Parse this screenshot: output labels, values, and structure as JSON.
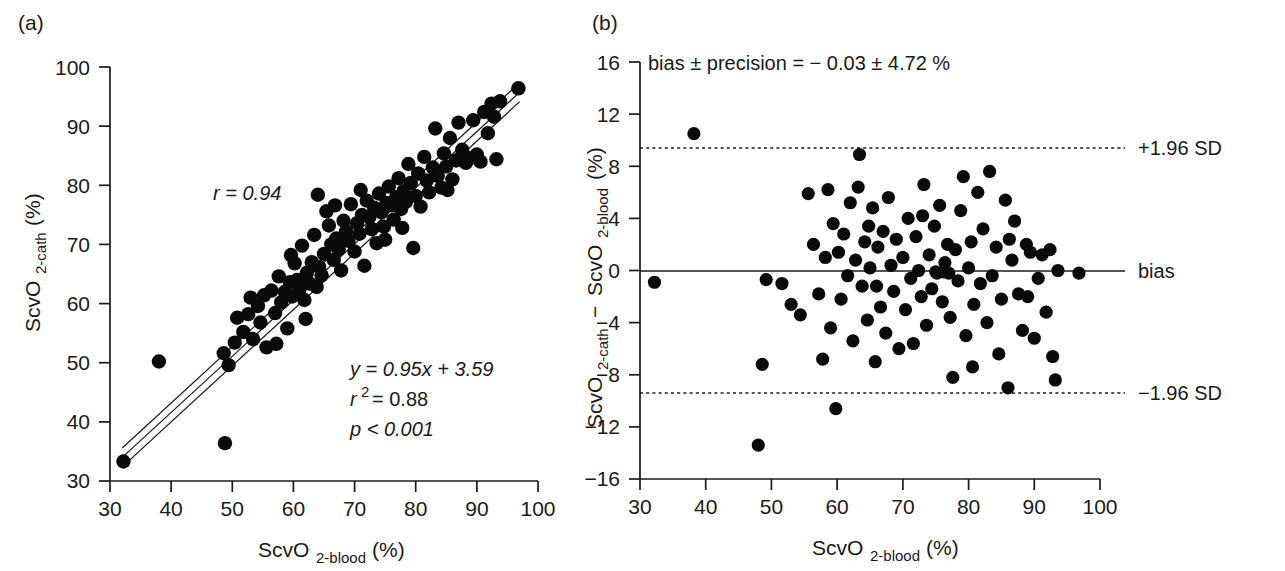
{
  "figure": {
    "background": "#ffffff",
    "marker_color": "#0a0a0a",
    "axis_color": "#1a1a1a"
  },
  "panel_a": {
    "tag": "(a)",
    "xlabel_main": "ScvO",
    "xlabel_sub": "2-blood",
    "xlabel_unit": "(%)",
    "ylabel_main": "ScvO",
    "ylabel_sub": "2-cath",
    "ylabel_unit": "(%)",
    "x_ticks": [
      "30",
      "40",
      "50",
      "60",
      "70",
      "80",
      "90",
      "100"
    ],
    "y_ticks": [
      "30",
      "40",
      "50",
      "60",
      "70",
      "80",
      "90",
      "100"
    ],
    "annotations": {
      "r": "r = 0.94",
      "equation": "y = 0.95x + 3.59",
      "r2_label": "r",
      "r2_sup": "2",
      "r2_value": "= 0.88",
      "p_value": "p < 0.001"
    }
  },
  "panel_b": {
    "tag": "(b)",
    "xlabel_main": "ScvO",
    "xlabel_sub": "2-blood",
    "xlabel_unit": "(%)",
    "ylabel_part1": "ScvO",
    "ylabel_sub1": "2-cath",
    "ylabel_minus": " − ",
    "ylabel_part2": "ScvO",
    "ylabel_sub2": "2-blood",
    "ylabel_unit": "(%)",
    "x_ticks": [
      "30",
      "40",
      "50",
      "60",
      "70",
      "80",
      "90",
      "100"
    ],
    "y_ticks": [
      "16",
      "12",
      "8",
      "4",
      "0",
      "−4",
      "−8",
      "−12",
      "−16"
    ],
    "header": "bias ± precision = − 0.03 ± 4.72 %",
    "line_labels": {
      "upper": "+1.96 SD",
      "bias": "bias",
      "lower": "−1.96 SD"
    }
  },
  "chart_data": [
    {
      "type": "scatter",
      "panel": "a",
      "title": "",
      "xlabel": "ScvO2-blood (%)",
      "ylabel": "ScvO2-cath (%)",
      "xlim": [
        30,
        100
      ],
      "ylim": [
        30,
        100
      ],
      "xticks": [
        30,
        40,
        50,
        60,
        70,
        80,
        90,
        100
      ],
      "yticks": [
        30,
        40,
        50,
        60,
        70,
        80,
        90,
        100
      ],
      "grid": false,
      "legend": "none",
      "annotations": [
        "r = 0.94",
        "y = 0.95x + 3.59",
        "r2 = 0.88",
        "p < 0.001"
      ],
      "fit": {
        "slope": 0.95,
        "intercept": 3.59,
        "r": 0.94,
        "r2": 0.88,
        "p": "<0.001",
        "band_offset": 1.6,
        "x_range": [
          32,
          97
        ]
      },
      "points": [
        [
          32.2,
          33.3
        ],
        [
          38.0,
          50.2
        ],
        [
          48.8,
          36.4
        ],
        [
          48.6,
          51.6
        ],
        [
          49.4,
          49.6
        ],
        [
          50.4,
          53.4
        ],
        [
          50.8,
          57.6
        ],
        [
          51.8,
          55.2
        ],
        [
          52.6,
          58.2
        ],
        [
          53.4,
          54.0
        ],
        [
          54.2,
          59.6
        ],
        [
          54.6,
          56.8
        ],
        [
          55.2,
          61.4
        ],
        [
          55.6,
          52.6
        ],
        [
          56.4,
          62.2
        ],
        [
          57.0,
          58.4
        ],
        [
          57.6,
          64.6
        ],
        [
          58.0,
          60.2
        ],
        [
          58.6,
          62.0
        ],
        [
          59.0,
          55.8
        ],
        [
          59.4,
          63.6
        ],
        [
          59.8,
          61.2
        ],
        [
          60.2,
          66.8
        ],
        [
          60.6,
          64.0
        ],
        [
          61.0,
          62.4
        ],
        [
          61.4,
          69.8
        ],
        [
          61.8,
          60.6
        ],
        [
          62.2,
          65.2
        ],
        [
          62.6,
          63.4
        ],
        [
          63.0,
          67.0
        ],
        [
          63.4,
          71.6
        ],
        [
          63.8,
          62.8
        ],
        [
          64.2,
          66.2
        ],
        [
          64.6,
          64.8
        ],
        [
          65.0,
          68.4
        ],
        [
          65.4,
          75.6
        ],
        [
          65.8,
          73.2
        ],
        [
          66.2,
          70.0
        ],
        [
          66.6,
          67.4
        ],
        [
          67.0,
          71.0
        ],
        [
          67.4,
          69.2
        ],
        [
          67.8,
          65.6
        ],
        [
          68.2,
          74.0
        ],
        [
          68.6,
          72.2
        ],
        [
          69.0,
          70.6
        ],
        [
          69.4,
          76.8
        ],
        [
          70.0,
          68.8
        ],
        [
          70.4,
          73.6
        ],
        [
          70.8,
          71.8
        ],
        [
          71.2,
          75.0
        ],
        [
          71.6,
          66.4
        ],
        [
          72.0,
          77.4
        ],
        [
          72.4,
          74.6
        ],
        [
          72.8,
          72.6
        ],
        [
          73.2,
          76.2
        ],
        [
          73.6,
          70.2
        ],
        [
          74.0,
          78.6
        ],
        [
          74.4,
          75.4
        ],
        [
          74.8,
          73.0
        ],
        [
          75.2,
          77.0
        ],
        [
          75.6,
          79.8
        ],
        [
          76.0,
          76.6
        ],
        [
          76.4,
          74.2
        ],
        [
          76.8,
          78.0
        ],
        [
          77.2,
          81.2
        ],
        [
          77.6,
          76.0
        ],
        [
          78.0,
          79.0
        ],
        [
          78.4,
          77.2
        ],
        [
          78.8,
          83.6
        ],
        [
          79.2,
          80.4
        ],
        [
          79.6,
          69.4
        ],
        [
          80.0,
          78.2
        ],
        [
          80.4,
          82.0
        ],
        [
          80.8,
          76.4
        ],
        [
          81.4,
          84.8
        ],
        [
          81.8,
          80.8
        ],
        [
          82.2,
          78.8
        ],
        [
          82.8,
          83.0
        ],
        [
          83.2,
          89.6
        ],
        [
          83.6,
          81.6
        ],
        [
          84.2,
          79.6
        ],
        [
          84.6,
          85.4
        ],
        [
          85.0,
          83.2
        ],
        [
          85.6,
          88.0
        ],
        [
          86.0,
          81.0
        ],
        [
          86.6,
          84.2
        ],
        [
          87.0,
          90.6
        ],
        [
          87.6,
          86.0
        ],
        [
          88.2,
          83.8
        ],
        [
          88.8,
          84.6
        ],
        [
          89.4,
          91.0
        ],
        [
          90.0,
          85.2
        ],
        [
          90.6,
          84.0
        ],
        [
          91.2,
          92.4
        ],
        [
          91.8,
          88.8
        ],
        [
          92.4,
          93.8
        ],
        [
          92.8,
          91.6
        ],
        [
          93.2,
          84.4
        ],
        [
          93.8,
          94.2
        ],
        [
          96.8,
          96.4
        ],
        [
          64.0,
          78.4
        ],
        [
          66.8,
          76.6
        ],
        [
          75.0,
          70.8
        ],
        [
          59.6,
          68.2
        ],
        [
          53.0,
          61.0
        ],
        [
          57.2,
          53.2
        ],
        [
          62.0,
          57.4
        ],
        [
          77.8,
          72.8
        ],
        [
          85.2,
          79.2
        ],
        [
          71.0,
          79.2
        ]
      ]
    },
    {
      "type": "scatter",
      "panel": "b",
      "title": "bias ± precision = − 0.03 ± 4.72 %",
      "xlabel": "ScvO2-blood (%)",
      "ylabel": "ScvO2-cath − ScvO2-blood (%)",
      "xlim": [
        30,
        100
      ],
      "ylim": [
        -16,
        16
      ],
      "xticks": [
        30,
        40,
        50,
        60,
        70,
        80,
        90,
        100
      ],
      "yticks": [
        -16,
        -12,
        -8,
        -4,
        0,
        4,
        8,
        12,
        16
      ],
      "grid": false,
      "legend": "none",
      "bias": -0.03,
      "precision": 4.72,
      "limits_of_agreement": {
        "upper": 9.4,
        "lower": -9.4,
        "upper_label": "+1.96 SD",
        "lower_label": "−1.96 SD",
        "bias_label": "bias"
      },
      "points": [
        [
          32.2,
          -0.9
        ],
        [
          38.2,
          10.5
        ],
        [
          48.0,
          -13.4
        ],
        [
          48.6,
          -7.2
        ],
        [
          49.2,
          -0.7
        ],
        [
          51.6,
          -1.0
        ],
        [
          53.0,
          -2.6
        ],
        [
          54.4,
          -3.4
        ],
        [
          55.6,
          5.9
        ],
        [
          56.4,
          2.0
        ],
        [
          57.2,
          -1.8
        ],
        [
          57.8,
          -6.8
        ],
        [
          58.6,
          6.2
        ],
        [
          59.0,
          -4.4
        ],
        [
          59.4,
          3.6
        ],
        [
          59.8,
          -10.6
        ],
        [
          60.2,
          1.4
        ],
        [
          60.6,
          -2.2
        ],
        [
          61.0,
          2.8
        ],
        [
          61.6,
          -0.4
        ],
        [
          62.0,
          5.2
        ],
        [
          62.4,
          -5.4
        ],
        [
          62.8,
          0.8
        ],
        [
          63.2,
          6.4
        ],
        [
          63.4,
          8.9
        ],
        [
          63.8,
          -1.2
        ],
        [
          64.2,
          2.2
        ],
        [
          64.6,
          -3.8
        ],
        [
          65.0,
          0.2
        ],
        [
          65.4,
          4.8
        ],
        [
          65.8,
          -7.0
        ],
        [
          66.2,
          1.8
        ],
        [
          66.6,
          -2.8
        ],
        [
          67.0,
          3.0
        ],
        [
          67.4,
          -4.8
        ],
        [
          67.8,
          5.6
        ],
        [
          68.2,
          0.4
        ],
        [
          68.6,
          -1.6
        ],
        [
          69.0,
          2.4
        ],
        [
          69.4,
          -6.0
        ],
        [
          70.0,
          1.0
        ],
        [
          70.4,
          -3.0
        ],
        [
          70.8,
          4.0
        ],
        [
          71.2,
          -0.6
        ],
        [
          71.6,
          -5.6
        ],
        [
          72.0,
          2.6
        ],
        [
          72.4,
          0.0
        ],
        [
          72.8,
          -2.0
        ],
        [
          73.2,
          6.6
        ],
        [
          73.6,
          -4.2
        ],
        [
          74.0,
          1.2
        ],
        [
          74.4,
          -1.4
        ],
        [
          74.8,
          3.4
        ],
        [
          75.2,
          -0.2
        ],
        [
          75.6,
          5.0
        ],
        [
          76.0,
          -2.4
        ],
        [
          76.4,
          0.6
        ],
        [
          76.8,
          2.0
        ],
        [
          77.2,
          -3.6
        ],
        [
          77.6,
          -8.2
        ],
        [
          78.0,
          1.6
        ],
        [
          78.4,
          -0.8
        ],
        [
          78.8,
          4.6
        ],
        [
          79.2,
          7.2
        ],
        [
          79.6,
          -5.0
        ],
        [
          80.0,
          0.2
        ],
        [
          80.4,
          2.2
        ],
        [
          80.8,
          -2.6
        ],
        [
          81.4,
          6.0
        ],
        [
          81.8,
          -1.0
        ],
        [
          82.2,
          3.2
        ],
        [
          82.8,
          -4.0
        ],
        [
          83.2,
          7.6
        ],
        [
          83.6,
          -0.4
        ],
        [
          84.2,
          1.8
        ],
        [
          84.6,
          -6.4
        ],
        [
          85.0,
          -2.2
        ],
        [
          85.6,
          5.4
        ],
        [
          86.0,
          -9.0
        ],
        [
          86.6,
          0.8
        ],
        [
          87.0,
          3.8
        ],
        [
          87.6,
          -1.8
        ],
        [
          88.2,
          -4.6
        ],
        [
          88.8,
          2.0
        ],
        [
          89.4,
          1.4
        ],
        [
          90.0,
          -5.2
        ],
        [
          90.6,
          -0.6
        ],
        [
          91.2,
          1.2
        ],
        [
          91.8,
          -3.2
        ],
        [
          92.4,
          1.6
        ],
        [
          92.8,
          -6.6
        ],
        [
          93.2,
          -8.4
        ],
        [
          93.6,
          0.0
        ],
        [
          96.8,
          -0.2
        ],
        [
          75.0,
          -0.1
        ],
        [
          76.2,
          -0.1
        ],
        [
          77.0,
          -0.2
        ],
        [
          64.8,
          3.4
        ],
        [
          58.2,
          1.0
        ],
        [
          86.2,
          2.4
        ],
        [
          89.0,
          -2.0
        ],
        [
          66.0,
          -1.2
        ],
        [
          73.0,
          4.2
        ],
        [
          80.6,
          -7.4
        ]
      ]
    }
  ]
}
